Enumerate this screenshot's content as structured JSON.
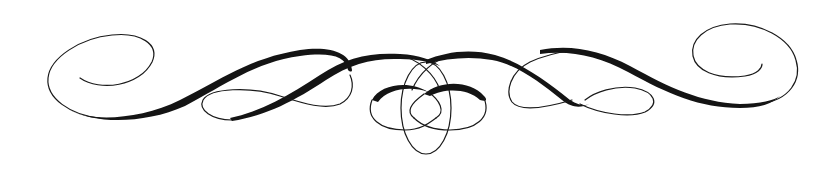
{
  "image": {
    "subject": "calligraphic-flourish-divider",
    "ink_color": "#141414",
    "background_color": "#ffffff"
  }
}
